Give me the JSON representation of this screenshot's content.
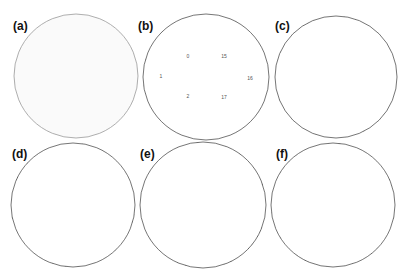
{
  "figure": {
    "panels": [
      {
        "id": "a",
        "label": "(a)",
        "cx": 76,
        "cy": 76,
        "r": 62,
        "style": "light-gasket",
        "density": 0.1
      },
      {
        "id": "b",
        "label": "(b)",
        "cx": 206,
        "cy": 77,
        "r": 63,
        "style": "numbered",
        "density": 0.45,
        "numbers": [
          {
            "text": "1",
            "dx": -45,
            "dy": 0
          },
          {
            "text": "0",
            "dx": -18,
            "dy": -20
          },
          {
            "text": "15",
            "dx": 18,
            "dy": -20
          },
          {
            "text": "16",
            "dx": 44,
            "dy": 2
          },
          {
            "text": "2",
            "dx": -18,
            "dy": 20
          },
          {
            "text": "17",
            "dx": 18,
            "dy": 21
          }
        ]
      },
      {
        "id": "c",
        "label": "(c)",
        "cx": 336,
        "cy": 77,
        "r": 61,
        "style": "medium",
        "density": 0.5
      },
      {
        "id": "d",
        "label": "(d)",
        "cx": 73,
        "cy": 205,
        "r": 62,
        "style": "dense",
        "density": 0.7
      },
      {
        "id": "e",
        "label": "(e)",
        "cx": 203,
        "cy": 205,
        "r": 63,
        "style": "dense-highlight",
        "density": 0.72
      },
      {
        "id": "f",
        "label": "(f)",
        "cx": 333,
        "cy": 205,
        "r": 62,
        "style": "dense-spiral",
        "density": 0.78
      }
    ]
  },
  "colors": {
    "ink": "#1a1a1a",
    "light_ink": "#9a9a9a",
    "highlight": "#bdbdbd",
    "background": "#ffffff"
  }
}
